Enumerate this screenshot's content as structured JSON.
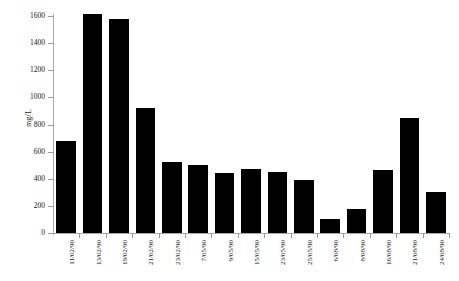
{
  "chart_data": {
    "type": "bar",
    "title": "",
    "subtitle": "",
    "xlabel": "",
    "ylabel": "mg/L",
    "ylim": [
      0,
      1600
    ],
    "ytick_step": 200,
    "yticks": [
      0,
      200,
      400,
      600,
      800,
      1000,
      1200,
      1400,
      1600
    ],
    "ytick_labels": [
      "0",
      "200",
      "400",
      "600",
      "800",
      "1000",
      "1200",
      "1400",
      "1600"
    ],
    "grid": false,
    "legend": false,
    "legend_position": "none",
    "bar_color": "#000000",
    "categories": [
      "11/02/90",
      "13/02/90",
      "19/02/90",
      "21/02/90",
      "23/02/90",
      "7/05/90",
      "9/05/90",
      "15/05/90",
      "23/05/90",
      "25/05/90",
      "6/08/90",
      "8/08/90",
      "16/08/90",
      "21/08/90",
      "24/08/90"
    ],
    "values": [
      680,
      1615,
      1580,
      925,
      525,
      505,
      440,
      470,
      450,
      390,
      100,
      175,
      465,
      845,
      300
    ]
  }
}
